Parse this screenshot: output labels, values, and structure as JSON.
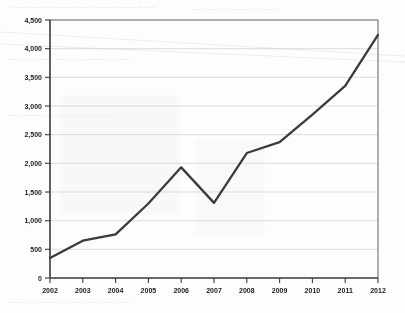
{
  "chart_data": {
    "type": "line",
    "title": "",
    "subtitle": "",
    "xlabel": "",
    "ylabel": "",
    "categories": [
      "2002",
      "2003",
      "2004",
      "2005",
      "2006",
      "2007",
      "2008",
      "2009",
      "2010",
      "2011",
      "2012"
    ],
    "values": [
      350,
      650,
      760,
      1300,
      1930,
      1310,
      2180,
      2370,
      2850,
      3350,
      4240
    ],
    "series": [
      {
        "name": "series-1",
        "values": [
          350,
          650,
          760,
          1300,
          1930,
          1310,
          2180,
          2370,
          2850,
          3350,
          4240
        ]
      }
    ],
    "ylim": [
      0,
      4500
    ],
    "ytick_values": [
      0,
      500,
      1000,
      1500,
      2000,
      2500,
      3000,
      3500,
      4000,
      4500
    ],
    "ytick_labels": [
      "0",
      "500",
      "1,000",
      "1,500",
      "2,000",
      "2,500",
      "3,000",
      "3,500",
      "4,000",
      "4,500"
    ],
    "xtick_labels": [
      "2002",
      "2003",
      "2004",
      "2005",
      "2006",
      "2007",
      "2008",
      "2009",
      "2010",
      "2011",
      "2012"
    ],
    "grid": "horizontal",
    "legend": "none",
    "line_color": "#3b3b3b",
    "grid_color": "#c9cdd2",
    "axis_color": "#3a3a3a",
    "background_color": "#fdfdfc",
    "annotations": []
  }
}
